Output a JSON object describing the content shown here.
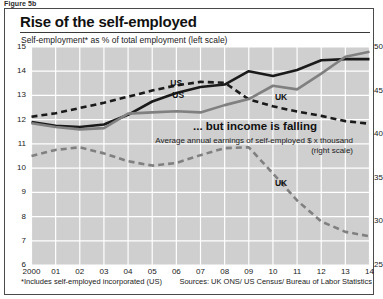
{
  "figure_label": "Figure 5b",
  "title": "Rise of the self-employed",
  "subtitle": "Self-employment* as % of total employment (left scale)",
  "mid_heading": "... but income is falling",
  "mid_subtitle": "Average annual earnings of self-employed $ x thousand (right scale)",
  "footnote": "*Includes self-employed incorporated (US)",
  "sources": "Sources: UK ONS/ US Census/ Bureau of Labor Statistics",
  "series_labels": {
    "employment_us": "US",
    "employment_uk": "UK",
    "earnings_us": "US",
    "earnings_uk": "UK"
  },
  "colors": {
    "plot_background": "#cfcfcf",
    "gridline": "#ffffff",
    "us_line": "#1a1a1a",
    "uk_line": "#808080",
    "frame": "#4a4a4a",
    "page": "#ffffff"
  },
  "chart_data": {
    "type": "line",
    "title": "Rise of the self-employed",
    "subtitle": "Self-employment* as % of total employment (left scale)",
    "annotation": "... but income is falling",
    "annotation_sub": "Average annual earnings of self-employed $ x thousand (right scale)",
    "xlabel": "",
    "x": [
      2000,
      2001,
      2002,
      2003,
      2004,
      2005,
      2006,
      2007,
      2008,
      2009,
      2010,
      2011,
      2012,
      2013,
      2014
    ],
    "xtick_labels": [
      "2000",
      "01",
      "02",
      "03",
      "04",
      "05",
      "06",
      "07",
      "08",
      "09",
      "10",
      "11",
      "12",
      "13",
      "14"
    ],
    "grid": true,
    "legend_position": "inline-labels",
    "left_axis": {
      "ylabel": "Self-employment as % of total employment",
      "ylim": [
        6,
        15
      ],
      "ticks": [
        6,
        7,
        8,
        9,
        10,
        11,
        12,
        13,
        14,
        15
      ],
      "series": [
        {
          "name": "US",
          "style": "solid",
          "color": "#1a1a1a",
          "values": [
            11.9,
            11.75,
            11.7,
            11.8,
            12.2,
            12.75,
            13.1,
            13.35,
            13.45,
            14.0,
            13.8,
            14.05,
            14.45,
            14.5,
            14.5
          ]
        },
        {
          "name": "UK",
          "style": "solid",
          "color": "#808080",
          "values": [
            11.85,
            11.7,
            11.6,
            11.65,
            12.25,
            12.3,
            12.35,
            12.3,
            12.6,
            12.85,
            13.4,
            13.25,
            13.9,
            14.6,
            14.8
          ]
        }
      ]
    },
    "right_axis": {
      "ylabel": "Average annual earnings of self-employed, $ x thousand",
      "ylim": [
        25,
        50
      ],
      "ticks": [
        25,
        30,
        35,
        40,
        45,
        50
      ],
      "series": [
        {
          "name": "US",
          "style": "dashed",
          "color": "#1a1a1a",
          "values": [
            42.0,
            42.4,
            43.0,
            43.6,
            44.3,
            45.0,
            45.6,
            46.0,
            45.9,
            44.0,
            43.2,
            42.6,
            42.1,
            41.5,
            41.2
          ]
        },
        {
          "name": "UK",
          "style": "dashed",
          "color": "#808080",
          "values": [
            37.5,
            38.2,
            38.5,
            37.8,
            36.9,
            36.4,
            36.7,
            37.6,
            38.4,
            38.5,
            35.5,
            32.4,
            30.0,
            28.8,
            28.3
          ]
        }
      ]
    }
  }
}
